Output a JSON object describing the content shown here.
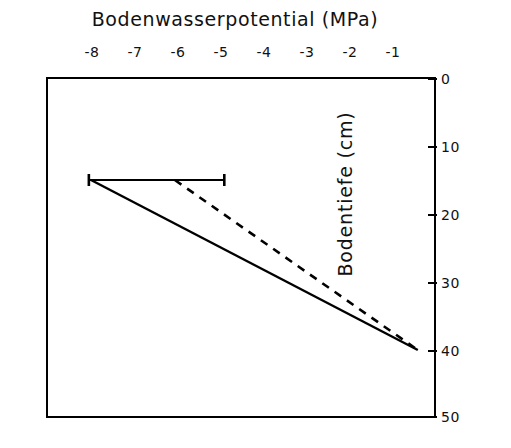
{
  "chart_data": {
    "type": "line",
    "title": "Bodenwasserpotential (MPa)",
    "xlabel": "Bodenwasserpotential (MPa)",
    "ylabel": "Bodentiefe (cm)",
    "xlim": [
      -8.5,
      0
    ],
    "ylim": [
      50,
      0
    ],
    "x_axis_position": "top",
    "y_axis_position": "right",
    "y_axis_inverted": true,
    "grid": false,
    "legend": "none",
    "xticks": [
      -8,
      -7,
      -6,
      -5,
      -4,
      -3,
      -2,
      -1
    ],
    "xtick_labels": [
      "-8",
      "-7",
      "-6",
      "-5",
      "-4",
      "-3",
      "-2",
      "-1"
    ],
    "yticks": [
      0,
      10,
      20,
      30,
      40,
      50
    ],
    "ytick_labels": [
      "0",
      "10",
      "20",
      "30",
      "40",
      "50"
    ],
    "series": [
      {
        "name": "solid-line",
        "style": "solid",
        "color": "#000000",
        "x": [
          -8.0,
          -0.4
        ],
        "y": [
          15.0,
          40.0
        ]
      },
      {
        "name": "dashed-line",
        "style": "dashed",
        "color": "#000000",
        "x": [
          -6.05,
          -0.4
        ],
        "y": [
          15.0,
          40.0
        ]
      }
    ],
    "error_bars": [
      {
        "name": "horizontal-error-bar",
        "orientation": "horizontal",
        "y": 15.0,
        "x_low": -8.05,
        "x_high": -4.9,
        "color": "#000000"
      }
    ]
  }
}
